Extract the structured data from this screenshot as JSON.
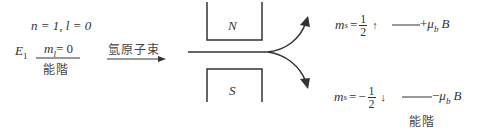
{
  "left_state": {
    "quantum_numbers": "n = 1, l = 0",
    "energy_label": "E",
    "energy_subscript": "1",
    "ml_label": "m",
    "ml_subscript": "l",
    "ml_value": "= 0",
    "level_label": "能階"
  },
  "beam": {
    "label": "氫原子束"
  },
  "magnet": {
    "north_label": "N",
    "south_label": "S"
  },
  "upper_state": {
    "ms_label": "m",
    "ms_subscript": "s",
    "equals": "=",
    "sign": "",
    "num": "1",
    "den": "2",
    "spin_arrow": "↑",
    "energy_sign": "+",
    "mu": "μ",
    "mu_subscript": "b",
    "field": "B"
  },
  "lower_state": {
    "ms_label": "m",
    "ms_subscript": "s",
    "equals": "=",
    "sign": "−",
    "num": "1",
    "den": "2",
    "spin_arrow": "↓",
    "energy_sign": "−",
    "mu": "μ",
    "mu_subscript": "b",
    "field": "B",
    "level_label": "能階"
  },
  "colors": {
    "line": "#333333",
    "text": "#333333"
  }
}
